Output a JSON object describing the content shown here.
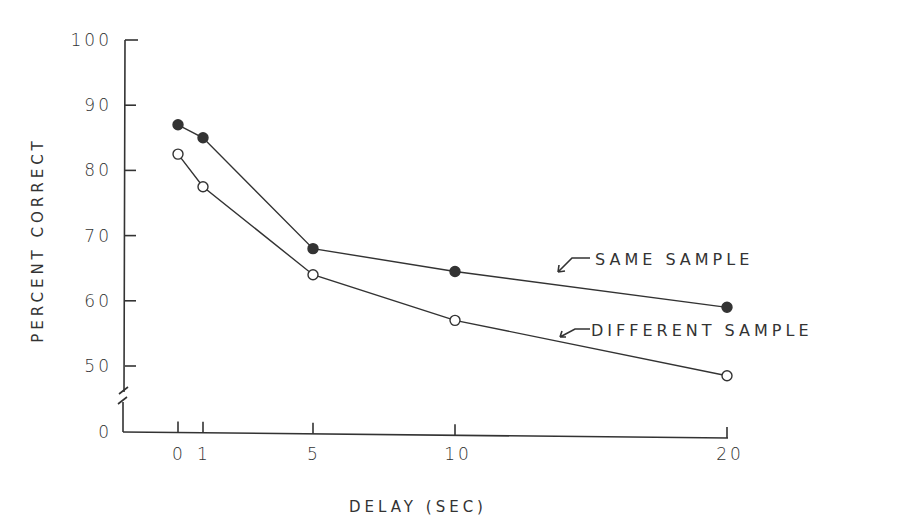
{
  "chart_data": {
    "type": "line",
    "title": "",
    "xlabel": "DELAY (SEC)",
    "ylabel": "PERCENT CORRECT",
    "x": [
      0,
      1,
      5,
      10,
      20
    ],
    "x_tick_labels": [
      "0",
      "1",
      "5",
      "10",
      "20"
    ],
    "y_tick_labels": [
      "0",
      "50",
      "60",
      "70",
      "80",
      "90",
      "100"
    ],
    "ylim": [
      45,
      100
    ],
    "y_axis_break": true,
    "grid": false,
    "series": [
      {
        "name": "SAME SAMPLE",
        "marker": "filled-circle",
        "values": [
          87,
          85,
          68,
          64.5,
          59
        ]
      },
      {
        "name": "DIFFERENT SAMPLE",
        "marker": "open-circle",
        "values": [
          82.5,
          77.5,
          64,
          57,
          48.5
        ]
      }
    ],
    "legend": {
      "position": "inline-annotations",
      "entries": [
        {
          "label": "SAME SAMPLE",
          "style": "arrow-pointing-to-line"
        },
        {
          "label": "DIFFERENT SAMPLE",
          "style": "arrow-pointing-to-line"
        }
      ]
    }
  },
  "labels": {
    "ylabel": "PERCENT CORRECT",
    "xlabel": "DELAY (SEC)",
    "same": "SAME SAMPLE",
    "different": "DIFFERENT SAMPLE"
  },
  "colors": {
    "ink": "#333333",
    "background": "#ffffff"
  }
}
